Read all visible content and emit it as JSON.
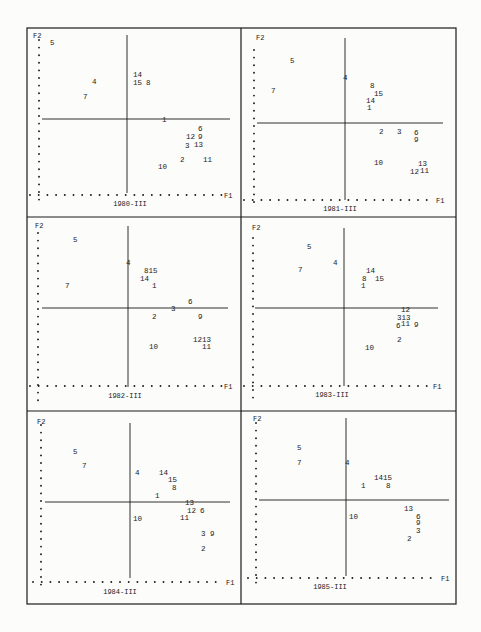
{
  "frame": {
    "x": 27,
    "y": 28,
    "right": 456,
    "bottom": 604,
    "col_split": 241,
    "row_splits": [
      217,
      411
    ]
  },
  "colors": {
    "ink": "#1a1a1a",
    "paper": "#fcfcfa"
  },
  "axis_labels": {
    "x": "F1",
    "y": "F2"
  },
  "chart_data": [
    {
      "type": "scatter",
      "title": "1980-III",
      "xlabel": "F1",
      "ylabel": "F2",
      "panel": {
        "x0": 27,
        "y0": 28,
        "x1": 241,
        "y1": 217
      },
      "axes": {
        "vx": 127,
        "vy0": 35,
        "vy1": 193,
        "hy": 119,
        "hx0": 42,
        "hx1": 230,
        "dot_x": 39,
        "dot_y": 195,
        "dot_y0": 40,
        "dot_y1": 203,
        "dot_x0": 30,
        "dot_x1": 222,
        "f1_x": 224,
        "f2_x": 33,
        "f2_y": 38,
        "title_x": 130,
        "title_y": 206
      },
      "points": [
        {
          "label": "5",
          "x": 50,
          "y": 45
        },
        {
          "label": "14",
          "x": 133,
          "y": 77
        },
        {
          "label": "15",
          "x": 133,
          "y": 85
        },
        {
          "label": "8",
          "x": 146,
          "y": 85
        },
        {
          "label": "4",
          "x": 92,
          "y": 84
        },
        {
          "label": "7",
          "x": 83,
          "y": 99
        },
        {
          "label": "1",
          "x": 162,
          "y": 122
        },
        {
          "label": "6",
          "x": 198,
          "y": 131
        },
        {
          "label": "12",
          "x": 186,
          "y": 139
        },
        {
          "label": "9",
          "x": 198,
          "y": 139
        },
        {
          "label": "3",
          "x": 185,
          "y": 148
        },
        {
          "label": "13",
          "x": 194,
          "y": 147
        },
        {
          "label": "2",
          "x": 180,
          "y": 162
        },
        {
          "label": "11",
          "x": 203,
          "y": 162
        },
        {
          "label": "10",
          "x": 158,
          "y": 169
        }
      ]
    },
    {
      "type": "scatter",
      "title": "1981-III",
      "xlabel": "F1",
      "ylabel": "F2",
      "panel": {
        "x0": 241,
        "y0": 28,
        "x1": 456,
        "y1": 217
      },
      "axes": {
        "vx": 345,
        "vy0": 38,
        "vy1": 200,
        "hy": 123,
        "hx0": 257,
        "hx1": 443,
        "dot_x": 254,
        "dot_y": 200,
        "dot_y0": 50,
        "dot_y1": 206,
        "dot_x0": 244,
        "dot_x1": 432,
        "f1_x": 436,
        "f2_x": 256,
        "f2_y": 40,
        "title_x": 340,
        "title_y": 211
      },
      "points": [
        {
          "label": "5",
          "x": 290,
          "y": 63
        },
        {
          "label": "4",
          "x": 343,
          "y": 80
        },
        {
          "label": "7",
          "x": 271,
          "y": 93
        },
        {
          "label": "8",
          "x": 370,
          "y": 88
        },
        {
          "label": "15",
          "x": 374,
          "y": 96
        },
        {
          "label": "14",
          "x": 366,
          "y": 103
        },
        {
          "label": "1",
          "x": 367,
          "y": 110
        },
        {
          "label": "2",
          "x": 379,
          "y": 134
        },
        {
          "label": "3",
          "x": 397,
          "y": 134
        },
        {
          "label": "6",
          "x": 414,
          "y": 135
        },
        {
          "label": "9",
          "x": 414,
          "y": 142
        },
        {
          "label": "10",
          "x": 374,
          "y": 165
        },
        {
          "label": "13",
          "x": 418,
          "y": 166
        },
        {
          "label": "12",
          "x": 410,
          "y": 174
        },
        {
          "label": "11",
          "x": 420,
          "y": 173
        }
      ]
    },
    {
      "type": "scatter",
      "title": "1982-III",
      "xlabel": "F1",
      "ylabel": "F2",
      "panel": {
        "x0": 27,
        "y0": 217,
        "x1": 241,
        "y1": 411
      },
      "axes": {
        "vx": 128,
        "vy0": 226,
        "vy1": 387,
        "hy": 308,
        "hx0": 42,
        "hx1": 228,
        "dot_x": 38,
        "dot_y": 386,
        "dot_y0": 233,
        "dot_y1": 403,
        "dot_x0": 30,
        "dot_x1": 222,
        "f1_x": 224,
        "f2_x": 35,
        "f2_y": 228,
        "title_x": 125,
        "title_y": 398
      },
      "points": [
        {
          "label": "5",
          "x": 73,
          "y": 242
        },
        {
          "label": "4",
          "x": 126,
          "y": 265
        },
        {
          "label": "815",
          "x": 144,
          "y": 273
        },
        {
          "label": "14",
          "x": 140,
          "y": 281
        },
        {
          "label": "1",
          "x": 152,
          "y": 288
        },
        {
          "label": "7",
          "x": 65,
          "y": 288
        },
        {
          "label": "6",
          "x": 188,
          "y": 304
        },
        {
          "label": "3",
          "x": 171,
          "y": 311
        },
        {
          "label": "2",
          "x": 152,
          "y": 319
        },
        {
          "label": "9",
          "x": 198,
          "y": 319
        },
        {
          "label": "1213",
          "x": 193,
          "y": 342
        },
        {
          "label": "10",
          "x": 149,
          "y": 349
        },
        {
          "label": "11",
          "x": 202,
          "y": 349
        }
      ]
    },
    {
      "type": "scatter",
      "title": "1983-III",
      "xlabel": "F1",
      "ylabel": "F2",
      "panel": {
        "x0": 241,
        "y0": 217,
        "x1": 456,
        "y1": 411
      },
      "axes": {
        "vx": 344,
        "vy0": 228,
        "vy1": 386,
        "hy": 308,
        "hx0": 255,
        "hx1": 438,
        "dot_x": 253,
        "dot_y": 386,
        "dot_y0": 238,
        "dot_y1": 400,
        "dot_x0": 244,
        "dot_x1": 428,
        "f1_x": 433,
        "f2_x": 252,
        "f2_y": 230,
        "title_x": 332,
        "title_y": 397
      },
      "points": [
        {
          "label": "5",
          "x": 307,
          "y": 249
        },
        {
          "label": "4",
          "x": 333,
          "y": 265
        },
        {
          "label": "7",
          "x": 298,
          "y": 272
        },
        {
          "label": "14",
          "x": 366,
          "y": 273
        },
        {
          "label": "8",
          "x": 362,
          "y": 281
        },
        {
          "label": "15",
          "x": 375,
          "y": 281
        },
        {
          "label": "1",
          "x": 361,
          "y": 288
        },
        {
          "label": "12",
          "x": 401,
          "y": 312
        },
        {
          "label": "313",
          "x": 397,
          "y": 320
        },
        {
          "label": "6",
          "x": 396,
          "y": 328
        },
        {
          "label": "11",
          "x": 401,
          "y": 326
        },
        {
          "label": "9",
          "x": 414,
          "y": 327
        },
        {
          "label": "2",
          "x": 397,
          "y": 342
        },
        {
          "label": "10",
          "x": 365,
          "y": 350
        }
      ]
    },
    {
      "type": "scatter",
      "title": "1984-III",
      "xlabel": "F1",
      "ylabel": "F2",
      "panel": {
        "x0": 27,
        "y0": 411,
        "x1": 241,
        "y1": 604
      },
      "axes": {
        "vx": 130,
        "vy0": 423,
        "vy1": 578,
        "hy": 502,
        "hx0": 45,
        "hx1": 230,
        "dot_x": 41,
        "dot_y": 582,
        "dot_y0": 425,
        "dot_y1": 592,
        "dot_x0": 33,
        "dot_x1": 222,
        "f1_x": 226,
        "f2_x": 37,
        "f2_y": 424,
        "title_x": 120,
        "title_y": 594
      },
      "points": [
        {
          "label": "5",
          "x": 73,
          "y": 454
        },
        {
          "label": "7",
          "x": 82,
          "y": 468
        },
        {
          "label": "4",
          "x": 135,
          "y": 475
        },
        {
          "label": "14",
          "x": 159,
          "y": 475
        },
        {
          "label": "15",
          "x": 168,
          "y": 482
        },
        {
          "label": "8",
          "x": 172,
          "y": 490
        },
        {
          "label": "1",
          "x": 155,
          "y": 498
        },
        {
          "label": "13",
          "x": 185,
          "y": 505
        },
        {
          "label": "12",
          "x": 187,
          "y": 513
        },
        {
          "label": "6",
          "x": 200,
          "y": 513
        },
        {
          "label": "11",
          "x": 180,
          "y": 520
        },
        {
          "label": "10",
          "x": 133,
          "y": 521
        },
        {
          "label": "3",
          "x": 201,
          "y": 536
        },
        {
          "label": "9",
          "x": 210,
          "y": 536
        },
        {
          "label": "2",
          "x": 201,
          "y": 551
        }
      ]
    },
    {
      "type": "scatter",
      "title": "1985-III",
      "xlabel": "F1",
      "ylabel": "F2",
      "panel": {
        "x0": 241,
        "y0": 411,
        "x1": 456,
        "y1": 604
      },
      "axes": {
        "vx": 346,
        "vy0": 418,
        "vy1": 576,
        "hy": 500,
        "hx0": 259,
        "hx1": 449,
        "dot_x": 256,
        "dot_y": 578,
        "dot_y0": 423,
        "dot_y1": 590,
        "dot_x0": 248,
        "dot_x1": 438,
        "f1_x": 441,
        "f2_x": 253,
        "f2_y": 421,
        "title_x": 330,
        "title_y": 589
      },
      "points": [
        {
          "label": "5",
          "x": 297,
          "y": 450
        },
        {
          "label": "7",
          "x": 297,
          "y": 465
        },
        {
          "label": "4",
          "x": 345,
          "y": 465
        },
        {
          "label": "1415",
          "x": 374,
          "y": 480
        },
        {
          "label": "1",
          "x": 361,
          "y": 488
        },
        {
          "label": "8",
          "x": 386,
          "y": 488
        },
        {
          "label": "13",
          "x": 404,
          "y": 511
        },
        {
          "label": "10",
          "x": 349,
          "y": 519
        },
        {
          "label": "6",
          "x": 416,
          "y": 519
        },
        {
          "label": "9",
          "x": 416,
          "y": 525
        },
        {
          "label": "3",
          "x": 416,
          "y": 533
        },
        {
          "label": "2",
          "x": 407,
          "y": 541
        }
      ]
    }
  ]
}
